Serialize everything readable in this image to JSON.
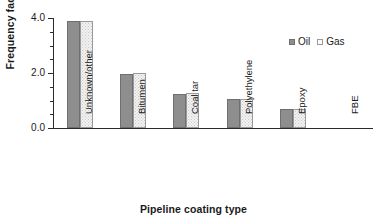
{
  "chart_data": {
    "type": "bar",
    "title": "",
    "subtitle": "",
    "xlabel": "Pipeline coating type",
    "ylabel": "Frequency factor",
    "categories": [
      "Unknown/other",
      "Bitumen",
      "Coal tar",
      "Polyethylene",
      "Epoxy",
      "FBE"
    ],
    "series": [
      {
        "name": "Oil",
        "color": "#8e8e8e",
        "values": [
          3.9,
          1.97,
          1.25,
          1.05,
          0.68,
          0.0
        ]
      },
      {
        "name": "Gas",
        "color": "#f2f2f2",
        "values": [
          3.9,
          2.0,
          1.27,
          1.05,
          0.68,
          0.0
        ]
      }
    ],
    "ylim": [
      0.0,
      4.0
    ],
    "yticks": [
      0.0,
      2.0,
      4.0
    ],
    "ytick_labels": [
      "0.0",
      "2.0",
      "4.0"
    ],
    "yminor_ticks": [
      0.5,
      1.0,
      1.5,
      2.5,
      3.0,
      3.5
    ],
    "grid": false,
    "legend": {
      "position": "top-right",
      "entries": [
        "Oil",
        "Gas"
      ]
    }
  },
  "axes": {
    "y_title": "Frequency factor",
    "x_title": "Pipeline coating type"
  },
  "legend": {
    "oil_label": "Oil",
    "gas_label": "Gas"
  },
  "colors": {
    "oil_fill": "#8e8e8e",
    "oil_edge": "#6f6f6f",
    "gas_fill": "#f2f2f2",
    "gas_edge": "#9a9a9a",
    "axis": "#2b2b2b",
    "text": "#1a1a1a",
    "background": "#ffffff"
  }
}
